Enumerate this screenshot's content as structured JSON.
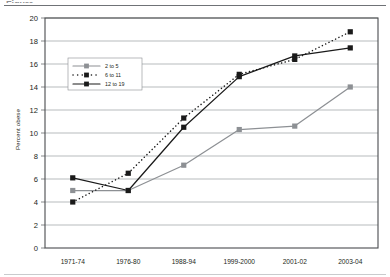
{
  "chart_data": {
    "type": "line",
    "title": "",
    "xlabel": "",
    "ylabel": "Percent obese",
    "categories": [
      "1971-74",
      "1976-80",
      "1988-94",
      "1999-2000",
      "2001-02",
      "2003-04"
    ],
    "ylim": [
      0,
      20
    ],
    "ytick_step": 2,
    "yticks": [
      "0",
      "2",
      "4",
      "6",
      "8",
      "10",
      "12",
      "14",
      "16",
      "18",
      "20"
    ],
    "grid": "horizontal",
    "legend_position": "upper-left-inside",
    "series": [
      {
        "name": "2 to 5",
        "color": "#8d9094",
        "line_style": "solid",
        "marker": "square",
        "values": [
          5.0,
          5.0,
          7.2,
          10.3,
          10.6,
          14.0
        ]
      },
      {
        "name": "6 to 11",
        "color": "#1a1a1a",
        "line_style": "dotted",
        "marker": "square",
        "values": [
          4.0,
          6.5,
          11.3,
          15.1,
          16.4,
          18.8
        ]
      },
      {
        "name": "12 to 19",
        "color": "#1a1a1a",
        "line_style": "solid",
        "marker": "square",
        "values": [
          6.1,
          5.0,
          10.5,
          14.9,
          16.7,
          17.4
        ]
      }
    ]
  },
  "figure": {
    "top_rule": "",
    "bottom_rule": "",
    "cropped_heading": "Figure"
  }
}
